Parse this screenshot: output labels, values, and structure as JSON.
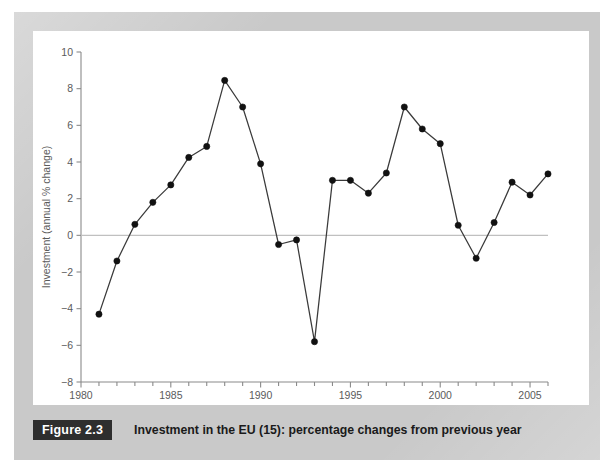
{
  "figure": {
    "number_label": "Figure 2.3",
    "caption": "Investment in the EU (15): percentage changes from previous year"
  },
  "colors": {
    "mat": "#c9c9c9",
    "card": "#ffffff",
    "badge_bg": "#2e2e2e",
    "badge_text": "#ffffff",
    "caption_text": "#1a1a1a",
    "axis": "#8a8a8a",
    "tick_text": "#5b5b5b",
    "zero_line": "#c0c0c0",
    "series_line": "#3a3a3a",
    "marker": "#111111"
  },
  "chart_data": {
    "type": "line",
    "title": "Investment in the EU (15): percentage changes from previous year",
    "xlabel": "",
    "ylabel": "Investment (annual % change)",
    "xlim": [
      1980,
      2006
    ],
    "ylim": [
      -8,
      10
    ],
    "ytick_step": 2,
    "yticks": [
      -8,
      -6,
      -4,
      -2,
      0,
      2,
      4,
      6,
      8,
      10
    ],
    "ytick_labels": [
      "−8",
      "−6",
      "−4",
      "−2",
      "0",
      "2",
      "4",
      "6",
      "8",
      "10"
    ],
    "xticks_major": [
      1980,
      1985,
      1990,
      1995,
      2000,
      2005
    ],
    "xtick_labels": [
      "1980",
      "1985",
      "1990",
      "1995",
      "2000",
      "2005"
    ],
    "xticks_minor_step": 1,
    "grid": false,
    "zero_line": true,
    "legend": null,
    "markers": "filled-circle",
    "x": [
      1981,
      1982,
      1983,
      1984,
      1985,
      1986,
      1987,
      1988,
      1989,
      1990,
      1991,
      1992,
      1993,
      1994,
      1995,
      1996,
      1997,
      1998,
      1999,
      2000,
      2001,
      2002,
      2003,
      2004,
      2005,
      2006
    ],
    "values": [
      -4.3,
      -1.4,
      0.6,
      1.8,
      2.75,
      4.25,
      4.85,
      8.45,
      7.0,
      3.9,
      -0.5,
      -0.25,
      -5.8,
      3.0,
      3.0,
      2.3,
      3.4,
      7.0,
      5.8,
      5.0,
      0.55,
      -1.25,
      0.7,
      2.9,
      2.2,
      3.35
    ]
  }
}
